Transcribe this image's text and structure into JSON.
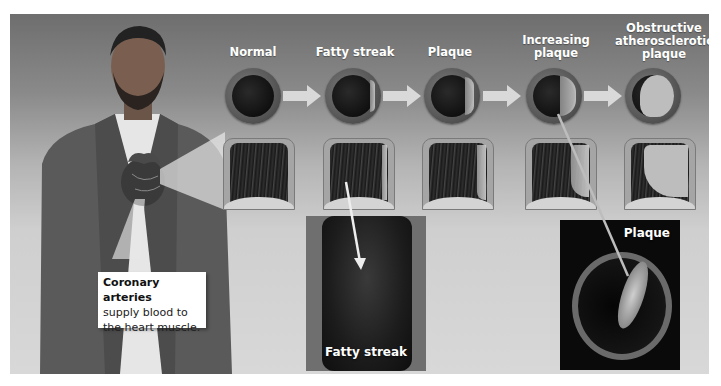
{
  "figure": {
    "stages": [
      {
        "label": "Normal",
        "plaque": "none"
      },
      {
        "label": "Fatty streak",
        "plaque": "thin"
      },
      {
        "label": "Plaque",
        "plaque": "small"
      },
      {
        "label": "Increasing plaque",
        "label_lines": [
          "Increasing",
          "plaque"
        ],
        "plaque": "medium"
      },
      {
        "label": "Obstructive atherosclerotic plaque",
        "label_lines": [
          "Obstructive",
          "atherosclerotic",
          "plaque"
        ],
        "plaque": "large"
      }
    ],
    "callout": {
      "title": "Coronary arteries",
      "body_line1": "supply blood to",
      "body_line2": "the heart muscle."
    },
    "photos": [
      {
        "label": "Fatty streak"
      },
      {
        "label": "Plaque"
      }
    ],
    "icons": {
      "stage_arrow": "right-arrow-icon",
      "heart": "heart-icon",
      "pointer": "pointer-line"
    },
    "colors": {
      "panel_top": "#6e6e6e",
      "panel_bottom": "#d8d8d8",
      "label_text": "#ffffff",
      "callout_bg": "#ffffff"
    }
  }
}
